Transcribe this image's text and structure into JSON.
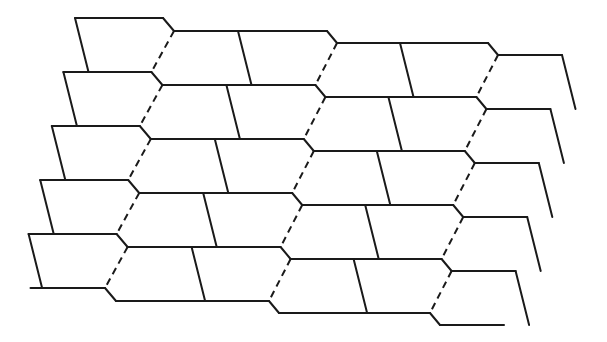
{
  "diagram": {
    "title": "",
    "rows": 5,
    "row_height": 54,
    "row_shift_x": -11.6,
    "line_color": "#1a1a1a",
    "background": "#ffffff",
    "groups": [
      {
        "name": "left-block",
        "top_y": 18,
        "cells_per_row": 1
      },
      {
        "name": "middle-left-pair",
        "top_y": 31,
        "cells_per_row": 2
      },
      {
        "name": "middle-right-pair",
        "top_y": 43,
        "cells_per_row": 2
      },
      {
        "name": "right-block",
        "top_y": 55,
        "cells_per_row": 1
      }
    ],
    "seams": [
      {
        "name": "seam-1",
        "style": "dashed"
      },
      {
        "name": "seam-2",
        "style": "dashed"
      },
      {
        "name": "seam-3",
        "style": "dashed"
      }
    ],
    "tile_count": 30
  }
}
